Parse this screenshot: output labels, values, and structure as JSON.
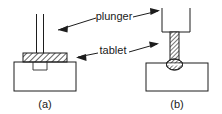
{
  "figure": {
    "background_color": "#ffffff",
    "ink_color": "#1d1d1d",
    "labels": {
      "plunger": "plunger",
      "tablet": "tablet"
    },
    "captions": {
      "left": "(a)",
      "right": "(b)"
    },
    "panels": [
      {
        "id": "a",
        "caption": "(a)",
        "description": "plunger rod raised above an uncompressed hatched tablet resting on the die",
        "parts": [
          {
            "name": "plunger-rod",
            "fill": "none",
            "hatched": false
          },
          {
            "name": "tablet-layer",
            "fill": "hatched",
            "hatched": true
          },
          {
            "name": "die-base",
            "fill": "none",
            "hatched": false
          },
          {
            "name": "die-cavity",
            "fill": "none",
            "hatched": false
          }
        ]
      },
      {
        "id": "b",
        "caption": "(b)",
        "description": "plunger lowered, hatched rod pressing the compressed tablet into the die cavity",
        "parts": [
          {
            "name": "plunger-head",
            "fill": "none",
            "hatched": false
          },
          {
            "name": "plunger-rod",
            "fill": "hatched",
            "hatched": true
          },
          {
            "name": "compressed-tablet",
            "fill": "hatched",
            "hatched": true
          },
          {
            "name": "die-base",
            "fill": "none",
            "hatched": false
          }
        ]
      }
    ],
    "annotations": [
      {
        "name": "plunger-annotation",
        "text": "plunger",
        "arrow_style": "double-ended",
        "points_to": [
          "panel-a-plunger-rod",
          "panel-b-plunger-head"
        ]
      },
      {
        "name": "tablet-annotation",
        "text": "tablet",
        "arrow_style": "double-ended",
        "points_to": [
          "panel-a-tablet-layer",
          "panel-b-plunger-rod"
        ]
      }
    ]
  }
}
